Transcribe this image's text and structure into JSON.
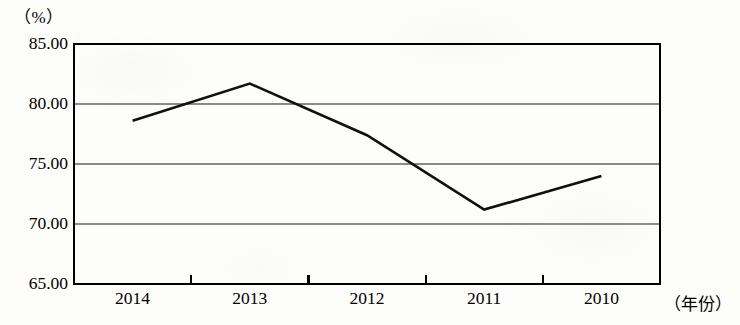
{
  "chart_data": {
    "type": "line",
    "title": "",
    "subtitle": "",
    "xlabel": "（年份）",
    "ylabel": "（%）",
    "categories": [
      "2014",
      "2013",
      "2012",
      "2011",
      "2010"
    ],
    "values": [
      78.6,
      81.7,
      77.4,
      71.2,
      74.0
    ],
    "series": [
      {
        "name": "",
        "values": [
          78.6,
          81.7,
          77.4,
          71.2,
          74.0
        ]
      }
    ],
    "ylim": [
      65.0,
      85.0
    ],
    "ytick_labels": [
      "65.00",
      "70.00",
      "75.00",
      "80.00",
      "85.00"
    ],
    "ytick_values": [
      65.0,
      70.0,
      75.0,
      80.0,
      85.0
    ],
    "gridlines": [
      70.0,
      75.0,
      80.0
    ],
    "grid": true,
    "legend": "none",
    "line_color": "#101010",
    "grid_color": "#8a8a8a",
    "axis_color": "#000000",
    "background_color": "#fdfdfb"
  },
  "axes": {
    "y_unit_label": "（%）",
    "x_axis_name": "（年份）"
  }
}
